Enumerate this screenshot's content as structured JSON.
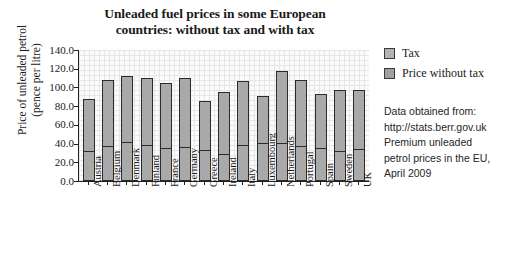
{
  "chart_data": {
    "type": "bar",
    "subtype": "stacked",
    "title": "Unleaded fuel prices in some European countries: without tax and with tax",
    "title_lines": [
      "Unleaded fuel prices in some European",
      "countries: without tax and with tax"
    ],
    "xlabel": "",
    "ylabel": "Price of unleaded petrol (pence per litre)",
    "ylabel_lines": [
      "Price of unleaded petrol",
      "(pence per litre)"
    ],
    "ylim": [
      0,
      140
    ],
    "ytick_step": 20,
    "ytick_labels": [
      "140.0",
      "120.0",
      "100.0",
      "80.0",
      "60.0",
      "40.0",
      "20.0",
      "0.0"
    ],
    "ytick_values": [
      140,
      120,
      100,
      80,
      60,
      40,
      20,
      0
    ],
    "grid": true,
    "legend_position": "right",
    "categories": [
      "Austria",
      "Belgium",
      "Denmark",
      "Finland",
      "France",
      "Germany",
      "Greece",
      "Ireland",
      "Italy",
      "Luxembourg",
      "Netherlands",
      "Portugal",
      "Spain",
      "Sweden",
      "UK"
    ],
    "series": [
      {
        "name": "Price without tax",
        "values": [
          30,
          35,
          40,
          36,
          33,
          34,
          31,
          27,
          36,
          39,
          38,
          35,
          33,
          30,
          32
        ]
      },
      {
        "name": "Tax",
        "values": [
          58,
          73,
          72,
          74,
          72,
          76,
          54,
          68,
          71,
          52,
          80,
          73,
          60,
          67,
          65
        ]
      }
    ],
    "totals": [
      88,
      108,
      112,
      110,
      105,
      110,
      85,
      95,
      107,
      91,
      118,
      108,
      93,
      97,
      97
    ]
  },
  "legend": {
    "items": [
      {
        "label": "Tax",
        "color": "#b4b4b4"
      },
      {
        "label": "Price without tax",
        "color": "#a0a0a0"
      }
    ]
  },
  "source_note": {
    "lines": [
      "Data obtained from:",
      "http://stats.berr.gov.uk",
      "Premium unleaded",
      "petrol prices in the EU,",
      "April 2009"
    ]
  },
  "colors": {
    "bar_fill": "#a9a9a9",
    "bar_outline": "#2b2b2b",
    "axis": "#202020",
    "grid": "#e6e6e6",
    "plot_background": "#fbfbfb"
  }
}
